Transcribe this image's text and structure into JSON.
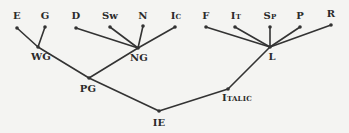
{
  "diagram": {
    "type": "tree",
    "title": "",
    "line_color": "#333333",
    "nodes": [
      {
        "id": "E",
        "label": "E",
        "x": 17,
        "y": 28
      },
      {
        "id": "G",
        "label": "G",
        "x": 45,
        "y": 27
      },
      {
        "id": "D",
        "label": "D",
        "x": 76,
        "y": 28
      },
      {
        "id": "Sw",
        "label": "Sw",
        "x": 110,
        "y": 27
      },
      {
        "id": "N",
        "label": "N",
        "x": 143,
        "y": 26
      },
      {
        "id": "Ic",
        "label": "Ic",
        "x": 175,
        "y": 27
      },
      {
        "id": "F",
        "label": "F",
        "x": 206,
        "y": 27
      },
      {
        "id": "It",
        "label": "It",
        "x": 235,
        "y": 27
      },
      {
        "id": "Sp",
        "label": "Sp",
        "x": 270,
        "y": 27
      },
      {
        "id": "P",
        "label": "P",
        "x": 300,
        "y": 27
      },
      {
        "id": "R",
        "label": "R",
        "x": 331,
        "y": 25
      },
      {
        "id": "WG",
        "label": "WG",
        "x": 38,
        "y": 47
      },
      {
        "id": "NG",
        "label": "NG",
        "x": 138,
        "y": 48
      },
      {
        "id": "L",
        "label": "L",
        "x": 270,
        "y": 47
      },
      {
        "id": "PG",
        "label": "PG",
        "x": 89,
        "y": 78
      },
      {
        "id": "Italic",
        "label": "Italic",
        "x": 258,
        "y": 83
      },
      {
        "id": "IE",
        "label": "IE",
        "x": 159,
        "y": 111
      }
    ],
    "edges": [
      [
        "E",
        "WG"
      ],
      [
        "G",
        "WG"
      ],
      [
        "WG",
        "PG"
      ],
      [
        "D",
        "NG"
      ],
      [
        "Sw",
        "NG"
      ],
      [
        "N",
        "NG"
      ],
      [
        "Ic",
        "NG"
      ],
      [
        "NG",
        "PG"
      ],
      [
        "F",
        "L"
      ],
      [
        "It",
        "L"
      ],
      [
        "Sp",
        "L"
      ],
      [
        "P",
        "L"
      ],
      [
        "R",
        "L"
      ],
      [
        "L",
        "Italic"
      ],
      [
        "PG",
        "IE"
      ],
      [
        "Italic",
        "IE"
      ]
    ],
    "labels": {
      "E": "E",
      "G": "G",
      "D": "D",
      "Sw": "Sw",
      "N": "N",
      "Ic": "Ic",
      "F": "F",
      "It": "It",
      "Sp": "Sp",
      "P": "P",
      "R": "R",
      "WG": "WG",
      "NG": "NG",
      "L": "L",
      "PG": "PG",
      "Italic": "Italic",
      "IE": "IE"
    }
  }
}
